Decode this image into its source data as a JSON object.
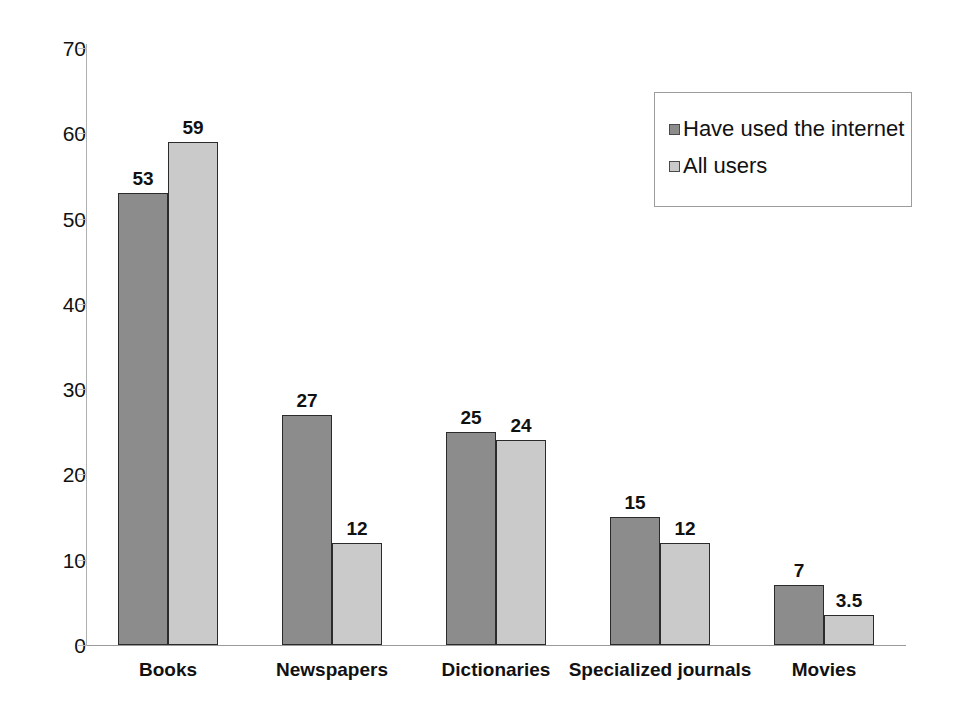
{
  "chart_data": {
    "type": "bar",
    "title": "",
    "xlabel": "",
    "ylabel": "",
    "ylim": [
      0,
      70
    ],
    "ytick_step": 10,
    "yticks": [
      "0",
      "10",
      "20",
      "30",
      "40",
      "50",
      "60",
      "70"
    ],
    "grid": false,
    "legend_position": "top-right",
    "categories": [
      "Books",
      "Newspapers",
      "Dictionaries",
      "Specialized journals",
      "Movies"
    ],
    "series": [
      {
        "name": "Have used the internet",
        "color": "#8c8c8c",
        "values": [
          53,
          27,
          25,
          15,
          7
        ],
        "value_labels": [
          "53",
          "27",
          "25",
          "15",
          "7"
        ]
      },
      {
        "name": "All users",
        "color": "#cacaca",
        "values": [
          59,
          12,
          24,
          12,
          3.5
        ],
        "value_labels": [
          "59",
          "12",
          "24",
          "12",
          "3.5"
        ]
      }
    ]
  },
  "legend": {
    "items": [
      {
        "label": "Have used the internet",
        "color": "#8c8c8c"
      },
      {
        "label": "All users",
        "color": "#cacaca"
      }
    ]
  },
  "axis": {
    "y_tick_labels": [
      "70",
      "60",
      "50",
      "40",
      "30",
      "20",
      "10",
      "0"
    ]
  }
}
